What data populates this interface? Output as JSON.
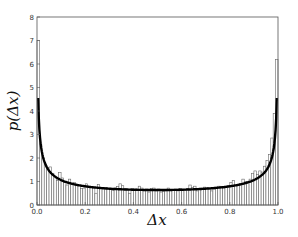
{
  "chart_data": {
    "type": "bar",
    "subtype": "histogram_with_fit_line",
    "title": "",
    "xlabel": "Δx",
    "ylabel": "p(Δx)",
    "xlim": [
      0.0,
      1.0
    ],
    "ylim": [
      0,
      8
    ],
    "grid": false,
    "legend": null,
    "x_ticks": [
      "0.0",
      "0.2",
      "0.4",
      "0.6",
      "0.8",
      "1.0"
    ],
    "y_ticks": [
      "0",
      "1",
      "2",
      "3",
      "4",
      "5",
      "6",
      "7",
      "8"
    ],
    "bins": 100,
    "bin_width": 0.01,
    "series": [
      {
        "name": "histogram",
        "style": "open bars, gray outline",
        "values": [
          7.0,
          2.6,
          2.0,
          1.75,
          1.6,
          1.62,
          1.35,
          1.2,
          1.05,
          1.38,
          1.15,
          0.95,
          0.85,
          1.1,
          0.9,
          0.95,
          0.85,
          0.82,
          0.7,
          0.72,
          0.9,
          0.78,
          0.75,
          0.72,
          0.5,
          0.88,
          0.72,
          0.7,
          0.75,
          0.68,
          0.7,
          0.62,
          0.72,
          0.78,
          0.9,
          0.82,
          0.7,
          0.66,
          0.5,
          0.7,
          0.65,
          0.68,
          0.8,
          0.72,
          0.62,
          0.68,
          0.55,
          0.7,
          0.72,
          0.6,
          0.68,
          0.55,
          0.58,
          0.6,
          0.72,
          0.65,
          0.62,
          0.68,
          0.6,
          0.7,
          0.66,
          0.62,
          0.7,
          0.85,
          0.75,
          0.8,
          0.6,
          0.68,
          0.72,
          0.76,
          0.74,
          0.7,
          0.6,
          0.68,
          0.76,
          0.8,
          0.78,
          0.72,
          0.75,
          0.82,
          0.95,
          1.05,
          0.85,
          0.82,
          0.92,
          1.1,
          1.0,
          1.0,
          1.1,
          1.35,
          1.45,
          1.3,
          1.45,
          1.4,
          1.65,
          1.9,
          2.15,
          2.85,
          3.9,
          6.2
        ]
      },
      {
        "name": "fit",
        "style": "thick black line",
        "function": "1/(pi*sqrt(x*(1-x)))",
        "minimum": 0.64,
        "edge_value": 4.5
      }
    ]
  }
}
